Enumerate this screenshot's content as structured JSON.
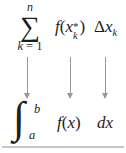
{
  "figure": {
    "top_row": {
      "sum": {
        "upper_limit": "n",
        "symbol": "∑",
        "lower_var": "k",
        "lower_rest": "= 1"
      },
      "function_term": {
        "name": "f",
        "open": "(",
        "variable": "x",
        "superscript": "*",
        "subscript": "k",
        "close": ")"
      },
      "delta_term": {
        "delta": "Δ",
        "variable": "x",
        "subscript": "k"
      }
    },
    "arrows": {
      "count": 3,
      "direction": "down"
    },
    "bottom_row": {
      "integral": {
        "symbol": "∫",
        "upper_bound": "b",
        "lower_bound": "a"
      },
      "integrand": {
        "name": "f",
        "open": "(",
        "variable": "x",
        "close": ")"
      },
      "differential": "dx"
    },
    "colors": {
      "text": "#1e1e1e",
      "arrow": "#979797",
      "rule": "#c6c6c6",
      "background": "#ffffff"
    }
  }
}
